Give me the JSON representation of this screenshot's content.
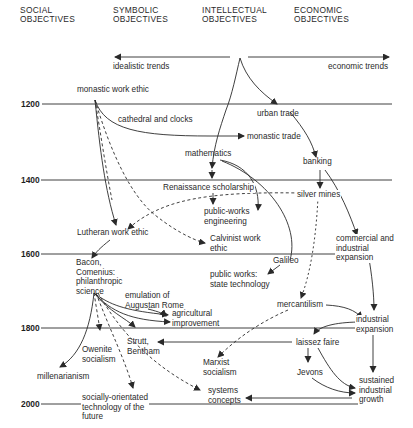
{
  "columns": [
    {
      "id": "social",
      "label": "SOCIAL\nOBJECTIVES"
    },
    {
      "id": "symbolic",
      "label": "SYMBOLIC\nOBJECTIVES"
    },
    {
      "id": "intellectual",
      "label": "INTELLECTUAL\nOBJECTIVES"
    },
    {
      "id": "economic",
      "label": "ECONOMIC\nOBJECTIVES"
    }
  ],
  "trends": {
    "left": "idealistic trends",
    "right": "economic trends"
  },
  "years": [
    "1200",
    "1400",
    "1600",
    "1800",
    "2000"
  ],
  "nodes": {
    "monastic_work_ethic": "monastic work ethic",
    "cathedral_clocks": "cathedral and clocks",
    "urban_trade": "urban trade",
    "monastic_trade": "monastic trade",
    "mathematics": "mathematics",
    "banking": "banking",
    "renaissance": "Renaissance scholarship",
    "silver_mines": "silver mines",
    "public_works_eng": "public-works\nengineering",
    "lutheran": "Lutheran work ethic",
    "calvinist": "Calvinist work\nethic",
    "commercial": "commercial and\nindustrial\nexpansion",
    "bacon": "Bacon,\nComenius:\nphilanthropic\nscience",
    "galileo": "Galileo",
    "public_works_state": "public works:\nstate technology",
    "emulation": "emulation of\nAugustan Rome",
    "agricultural": "agricultural\nimprovement",
    "mercantilism": "mercantilism",
    "industrial": "industrial\nexpansion",
    "owenite": "Owenite\nsocialism",
    "strutt": "Strutt,\nBentham",
    "laissez": "laissez faire",
    "marxist": "Marxist\nsocialism",
    "jevons": "Jevons",
    "millenarianism": "millenarianism",
    "sustained": "sustained\nindustrial\ngrowth",
    "systems": "systems\nconcepts",
    "socially": "socially-orientated\ntechnology of the\nfuture"
  },
  "colors": {
    "ink": "#2a2a2a",
    "background": "#ffffff"
  }
}
